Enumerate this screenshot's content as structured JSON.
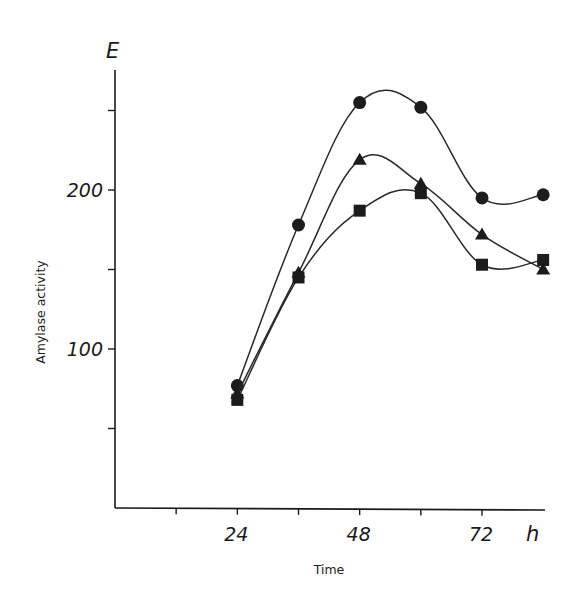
{
  "chart_data": {
    "type": "line",
    "title": "",
    "xlabel": "Time",
    "ylabel": "Amylase activity",
    "x_unit": "h",
    "y_unit": "E",
    "x": [
      24,
      36,
      48,
      60,
      72,
      84
    ],
    "x_ticks": [
      12,
      24,
      36,
      48,
      60,
      72
    ],
    "x_tick_labels": [
      "",
      "24",
      "",
      "48",
      "",
      "72"
    ],
    "y_ticks": [
      50,
      100,
      150,
      200,
      250
    ],
    "y_tick_labels": [
      "",
      "100",
      "",
      "200",
      ""
    ],
    "xlim": [
      0,
      86
    ],
    "ylim": [
      0,
      275
    ],
    "grid": false,
    "legend": "none",
    "series": [
      {
        "name": "circle",
        "marker": "circle",
        "values": [
          77,
          178,
          255,
          252,
          195,
          197
        ]
      },
      {
        "name": "triangle",
        "marker": "triangle",
        "values": [
          72,
          148,
          219,
          204,
          172,
          150
        ]
      },
      {
        "name": "square",
        "marker": "square",
        "values": [
          68,
          145,
          187,
          198,
          153,
          156
        ]
      }
    ]
  },
  "labels": {
    "y_unit": "E",
    "x_unit": "h",
    "xlabel": "Time",
    "ylabel": "Amylase activity",
    "caption_fragment": "Figure caption (cut off at bottom edge)"
  }
}
